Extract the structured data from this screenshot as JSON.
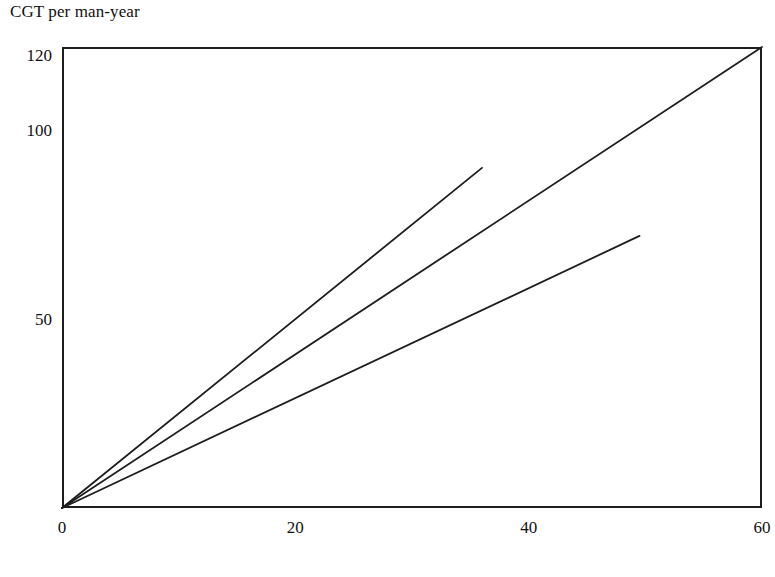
{
  "chart_data": {
    "type": "line",
    "title": "",
    "xlabel": "Annual cost per employee (US$ thousands)",
    "ylabel": "CGT per man-year",
    "xlim": [
      0,
      60
    ],
    "ylim": [
      0,
      122
    ],
    "grid": false,
    "legend": "none",
    "xticks": [
      {
        "value": 0,
        "label": "0"
      },
      {
        "value": 20,
        "label": "20"
      },
      {
        "value": 40,
        "label": "40"
      },
      {
        "value": 60,
        "label": "60"
      }
    ],
    "yticks": [
      {
        "value": 50,
        "label": "50"
      },
      {
        "value": 100,
        "label": "100"
      },
      {
        "value": 120,
        "label": "120"
      }
    ],
    "series": [
      {
        "name": "steep-line",
        "points": [
          [
            0,
            0
          ],
          [
            36,
            90
          ]
        ],
        "color": "#1d1d1d"
      },
      {
        "name": "diagonal-line",
        "points": [
          [
            0,
            0
          ],
          [
            60,
            122
          ]
        ],
        "color": "#1d1d1d"
      },
      {
        "name": "shallow-line",
        "points": [
          [
            0,
            0
          ],
          [
            49.5,
            72
          ]
        ],
        "color": "#1d1d1d"
      }
    ]
  },
  "labels": {
    "y_axis_title": "CGT per man-year",
    "x_axis_title": "Annual cost per employee (US$ thousands)",
    "y_tick_120": "120",
    "y_tick_100": "100",
    "y_tick_50": "50",
    "x_tick_0": "0",
    "x_tick_20": "20",
    "x_tick_40": "40",
    "x_tick_60": "60"
  },
  "colors": {
    "axis": "#1d1d1d",
    "line": "#1d1d1d",
    "background": "#ffffff",
    "text": "#111111"
  }
}
